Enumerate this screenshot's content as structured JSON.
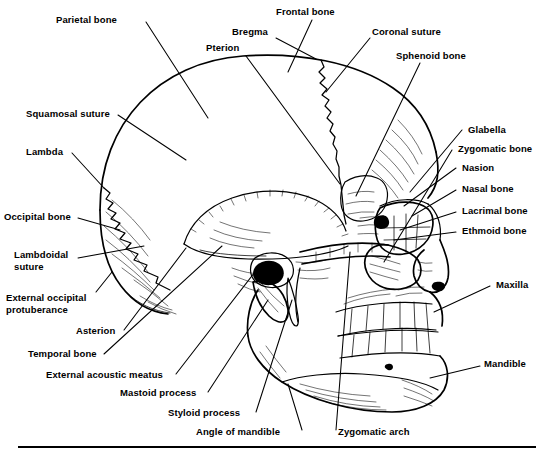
{
  "figure": {
    "type": "anatomical-diagram",
    "view": "lateral (side) view, facing right",
    "line_color": "#000000",
    "background_color": "#ffffff",
    "has_bottom_rule": true
  },
  "labels": {
    "parietal_bone": "Parietal bone",
    "frontal_bone": "Frontal bone",
    "bregma": "Bregma",
    "pterion": "Pterion",
    "coronal_suture": "Coronal suture",
    "sphenoid_bone": "Sphenoid bone",
    "squamosal_suture": "Squamosal suture",
    "lambda": "Lambda",
    "occipital_bone": "Occipital bone",
    "lambdoidal_suture_line1": "Lambdoidal",
    "lambdoidal_suture_line2": "suture",
    "external_occipital_protuberance_line1": "External occipital",
    "external_occipital_protuberance_line2": "protuberance",
    "asterion": "Asterion",
    "temporal_bone": "Temporal bone",
    "external_acoustic_meatus": "External acoustic meatus",
    "mastoid_process": "Mastoid process",
    "styloid_process": "Styloid process",
    "angle_of_mandible": "Angle of mandible",
    "zygomatic_arch": "Zygomatic arch",
    "glabella": "Glabella",
    "zygomatic_bone": "Zygomatic bone",
    "nasion": "Nasion",
    "nasal_bone": "Nasal bone",
    "lacrimal_bone": "Lacrimal bone",
    "ethmoid_bone": "Ethmoid bone",
    "maxilla": "Maxilla",
    "mandible": "Mandible"
  }
}
